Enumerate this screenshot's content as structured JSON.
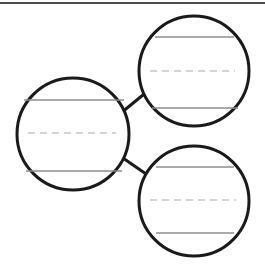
{
  "diagram": {
    "canvas": {
      "width": 265,
      "height": 268,
      "background": "#ffffff"
    },
    "colors": {
      "outline": "#1a1a1a",
      "solid_rule": "#8c8c8c",
      "dashed_rule": "#c8c8c8",
      "connector": "#1a1a1a",
      "top_border": "#4d4d4d"
    },
    "top_border": {
      "label": "top-border-rule",
      "x1": 0,
      "y1": 3,
      "x2": 265,
      "y2": 3,
      "stroke_width": 2
    },
    "circles": [
      {
        "id": "circle-left",
        "label": "Left circle",
        "cx": 73,
        "cy": 134,
        "r": 56,
        "stroke_width": 3,
        "rules": [
          {
            "id": "rule-left-upper",
            "style": "solid",
            "y": 100,
            "x1": 24,
            "x2": 124
          },
          {
            "id": "rule-left-middle",
            "style": "dashed",
            "y": 133,
            "x1": 28,
            "x2": 116
          },
          {
            "id": "rule-left-lower",
            "style": "solid",
            "y": 171,
            "x1": 26,
            "x2": 122
          }
        ]
      },
      {
        "id": "circle-top-right",
        "label": "Top right circle",
        "cx": 194,
        "cy": 71,
        "r": 55,
        "stroke_width": 3,
        "rules": [
          {
            "id": "rule-topright-upper",
            "style": "solid",
            "y": 37,
            "x1": 155,
            "x2": 234
          },
          {
            "id": "rule-topright-middle",
            "style": "dashed",
            "y": 71,
            "x1": 150,
            "x2": 235
          },
          {
            "id": "rule-topright-lower",
            "style": "solid",
            "y": 108,
            "x1": 152,
            "x2": 238
          }
        ]
      },
      {
        "id": "circle-bottom-right",
        "label": "Bottom right circle",
        "cx": 194,
        "cy": 201,
        "r": 55,
        "stroke_width": 3,
        "rules": [
          {
            "id": "rule-bottomright-upper",
            "style": "solid",
            "y": 167,
            "x1": 156,
            "x2": 234
          },
          {
            "id": "rule-bottomright-middle",
            "style": "dashed",
            "y": 200,
            "x1": 150,
            "x2": 236
          },
          {
            "id": "rule-bottomright-lower",
            "style": "solid",
            "y": 233,
            "x1": 156,
            "x2": 234
          }
        ]
      }
    ],
    "connectors": [
      {
        "id": "connector-left-to-top-right",
        "label": "Connector from left circle to top right circle",
        "x1": 121,
        "y1": 113,
        "x2": 149,
        "y2": 90,
        "stroke_width": 3
      },
      {
        "id": "connector-left-to-bottom-right",
        "label": "Connector from left circle to bottom right circle",
        "x1": 120,
        "y1": 156,
        "x2": 149,
        "y2": 176,
        "stroke_width": 3
      }
    ]
  }
}
